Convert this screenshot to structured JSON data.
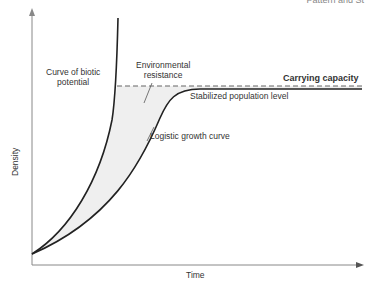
{
  "header": {
    "text": "Pattern and St"
  },
  "diagram": {
    "type": "population growth curves",
    "axes": {
      "x_label": "Time",
      "y_label": "Density"
    },
    "labels": {
      "biotic_potential": [
        "Curve of biotic",
        "potential"
      ],
      "environmental_resistance": [
        "Environmental",
        "resistance"
      ],
      "carrying_capacity": "Carrying capacity",
      "stabilized_level": "Stabilized population level",
      "logistic_curve": "Logistic growth curve"
    },
    "colors": {
      "line": "#222222",
      "shade": "#efefef",
      "dashed": "#666666",
      "axis": "#888888"
    }
  }
}
